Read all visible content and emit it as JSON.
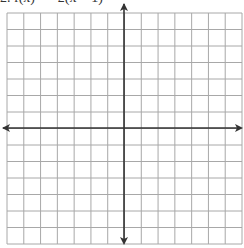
{
  "problem": {
    "label": "2. f(x) = −2(x − 1)²",
    "clipped": true
  },
  "grid": {
    "columns": 14,
    "rows": 14,
    "x_left": 7,
    "x_right": 242,
    "y_top": 13,
    "y_bottom": 244,
    "line_color": "#a8a8a8",
    "axis_color": "#333333"
  },
  "axes": {
    "x_axis_y": 128,
    "y_axis_x": 124,
    "arrows": [
      "left",
      "right",
      "up",
      "down"
    ]
  }
}
